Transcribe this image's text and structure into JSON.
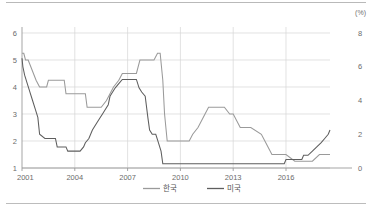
{
  "figure": {
    "unit_label": "(%)",
    "left_axis": {
      "ticks": [
        1,
        2,
        3,
        4,
        5,
        6
      ],
      "min": 1,
      "max": 6
    },
    "right_axis": {
      "ticks": [
        0,
        2,
        4,
        6,
        8
      ],
      "min": 0,
      "max": 8
    },
    "x_axis": {
      "ticks": [
        "2001",
        "2004",
        "2007",
        "2010",
        "2013",
        "2016"
      ],
      "min": 2001.0,
      "max": 2018.5
    },
    "legend": {
      "items": [
        {
          "label": "한국",
          "color": "#9a9a9a"
        },
        {
          "label": "미국",
          "color": "#5e5e5e"
        }
      ]
    }
  },
  "chart_data": {
    "type": "line",
    "title": "",
    "subtitle": "",
    "xlabel": "",
    "ylabel": "(%)",
    "grid": true,
    "legend_position": "bottom-center",
    "xlim": [
      2001.0,
      2018.5
    ],
    "y_left_lim": [
      1,
      6
    ],
    "y_right_lim": [
      0,
      8
    ],
    "y_left_ticks": [
      1,
      2,
      3,
      4,
      5,
      6
    ],
    "y_right_ticks": [
      0,
      2,
      4,
      6,
      8
    ],
    "x_ticks": [
      2001,
      2004,
      2007,
      2010,
      2013,
      2016
    ],
    "series": [
      {
        "name": "한국",
        "axis": "left",
        "color": "#9a9a9a",
        "x": [
          2001.0,
          2001.1,
          2001.2,
          2001.35,
          2001.5,
          2001.65,
          2001.8,
          2002.0,
          2002.4,
          2002.5,
          2003.0,
          2003.4,
          2003.5,
          2004.0,
          2004.6,
          2004.7,
          2005.0,
          2005.5,
          2005.8,
          2006.0,
          2006.2,
          2006.5,
          2006.7,
          2007.0,
          2007.5,
          2007.7,
          2008.0,
          2008.5,
          2008.7,
          2008.85,
          2009.0,
          2009.1,
          2009.25,
          2009.4,
          2010.0,
          2010.5,
          2010.7,
          2011.0,
          2011.2,
          2011.4,
          2011.6,
          2012.0,
          2012.5,
          2012.8,
          2013.0,
          2013.4,
          2014.0,
          2014.6,
          2014.8,
          2015.0,
          2015.2,
          2015.5,
          2016.0,
          2016.5,
          2016.8,
          2017.0,
          2017.5,
          2017.9,
          2018.0,
          2018.5
        ],
        "y": [
          5.25,
          5.25,
          5.0,
          5.0,
          4.75,
          4.5,
          4.25,
          4.0,
          4.0,
          4.25,
          4.25,
          4.25,
          3.75,
          3.75,
          3.75,
          3.25,
          3.25,
          3.25,
          3.5,
          3.75,
          4.0,
          4.25,
          4.5,
          4.5,
          4.5,
          5.0,
          5.0,
          5.0,
          5.25,
          5.25,
          4.25,
          3.0,
          2.0,
          2.0,
          2.0,
          2.0,
          2.25,
          2.5,
          2.75,
          3.0,
          3.25,
          3.25,
          3.25,
          3.0,
          3.0,
          2.5,
          2.5,
          2.25,
          2.0,
          1.75,
          1.5,
          1.5,
          1.5,
          1.25,
          1.25,
          1.25,
          1.25,
          1.5,
          1.5,
          1.5
        ]
      },
      {
        "name": "미국",
        "axis": "right",
        "color": "#5e5e5e",
        "x": [
          2001.0,
          2001.05,
          2001.15,
          2001.3,
          2001.45,
          2001.6,
          2001.75,
          2001.9,
          2002.0,
          2002.3,
          2002.9,
          2003.0,
          2003.5,
          2003.6,
          2004.0,
          2004.3,
          2004.5,
          2004.6,
          2004.8,
          2005.0,
          2005.3,
          2005.6,
          2005.9,
          2006.0,
          2006.3,
          2006.5,
          2006.7,
          2007.0,
          2007.5,
          2007.65,
          2007.8,
          2008.0,
          2008.15,
          2008.25,
          2008.4,
          2008.6,
          2008.75,
          2008.9,
          2009.0,
          2009.5,
          2010.0,
          2011.0,
          2012.0,
          2013.0,
          2014.0,
          2015.0,
          2015.9,
          2016.0,
          2016.4,
          2016.9,
          2017.0,
          2017.25,
          2017.5,
          2017.75,
          2018.0,
          2018.2,
          2018.4,
          2018.5
        ],
        "y": [
          6.5,
          6.0,
          5.5,
          5.0,
          4.5,
          4.0,
          3.5,
          3.0,
          2.0,
          1.75,
          1.75,
          1.25,
          1.25,
          1.0,
          1.0,
          1.0,
          1.25,
          1.5,
          1.75,
          2.25,
          2.75,
          3.25,
          3.75,
          4.25,
          4.75,
          5.0,
          5.25,
          5.25,
          5.25,
          4.75,
          4.5,
          4.25,
          3.0,
          2.25,
          2.0,
          2.0,
          1.5,
          1.0,
          0.25,
          0.25,
          0.25,
          0.25,
          0.25,
          0.25,
          0.25,
          0.25,
          0.25,
          0.5,
          0.5,
          0.5,
          0.75,
          0.75,
          1.0,
          1.25,
          1.5,
          1.75,
          2.0,
          2.25
        ]
      }
    ]
  }
}
